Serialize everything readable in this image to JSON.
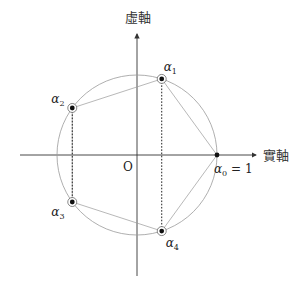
{
  "diagram": {
    "axes": {
      "imaginary_label": "虛軸",
      "real_label": "實軸",
      "origin_label": "O"
    },
    "roots": [
      {
        "symbol": "α",
        "subscript": "0",
        "suffix": " = 1",
        "angle_deg": 0,
        "ringed": false
      },
      {
        "symbol": "α",
        "subscript": "1",
        "suffix": "",
        "angle_deg": 72,
        "ringed": true
      },
      {
        "symbol": "α",
        "subscript": "2",
        "suffix": "",
        "angle_deg": 144,
        "ringed": true
      },
      {
        "symbol": "α",
        "subscript": "3",
        "suffix": "",
        "angle_deg": 216,
        "ringed": true
      },
      {
        "symbol": "α",
        "subscript": "4",
        "suffix": "",
        "angle_deg": 288,
        "ringed": true
      }
    ],
    "conjugate_pairs": [
      [
        1,
        4
      ],
      [
        2,
        3
      ]
    ],
    "colors": {
      "circle": "#9a9a9a",
      "axis": "#333333",
      "dot": "#111111"
    }
  }
}
